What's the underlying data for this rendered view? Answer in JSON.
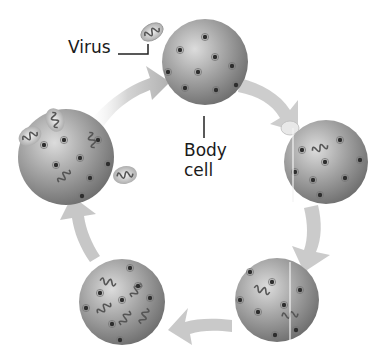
{
  "diagram": {
    "type": "cycle",
    "title": "",
    "labels": {
      "virus": "Virus",
      "body_cell_line1": "Body",
      "body_cell_line2": "cell"
    },
    "stages": [
      {
        "id": "stage-1",
        "description": "Virus approaches healthy body cell",
        "position": "top"
      },
      {
        "id": "stage-2",
        "description": "Virus attaches and injects genetic material",
        "position": "right"
      },
      {
        "id": "stage-3",
        "description": "Viral genetic material inside cell",
        "position": "bottom-right"
      },
      {
        "id": "stage-4",
        "description": "Cell makes copies of virus",
        "position": "bottom-left"
      },
      {
        "id": "stage-5",
        "description": "New viruses released from cell",
        "position": "left"
      }
    ],
    "arrow_direction": "clockwise",
    "colors": {
      "cell": "#8a8a8a",
      "cell_highlight": "#d6d6d6",
      "arrow": "#b8b8b8",
      "text": "#1a1a1a",
      "background": "#ffffff"
    }
  }
}
